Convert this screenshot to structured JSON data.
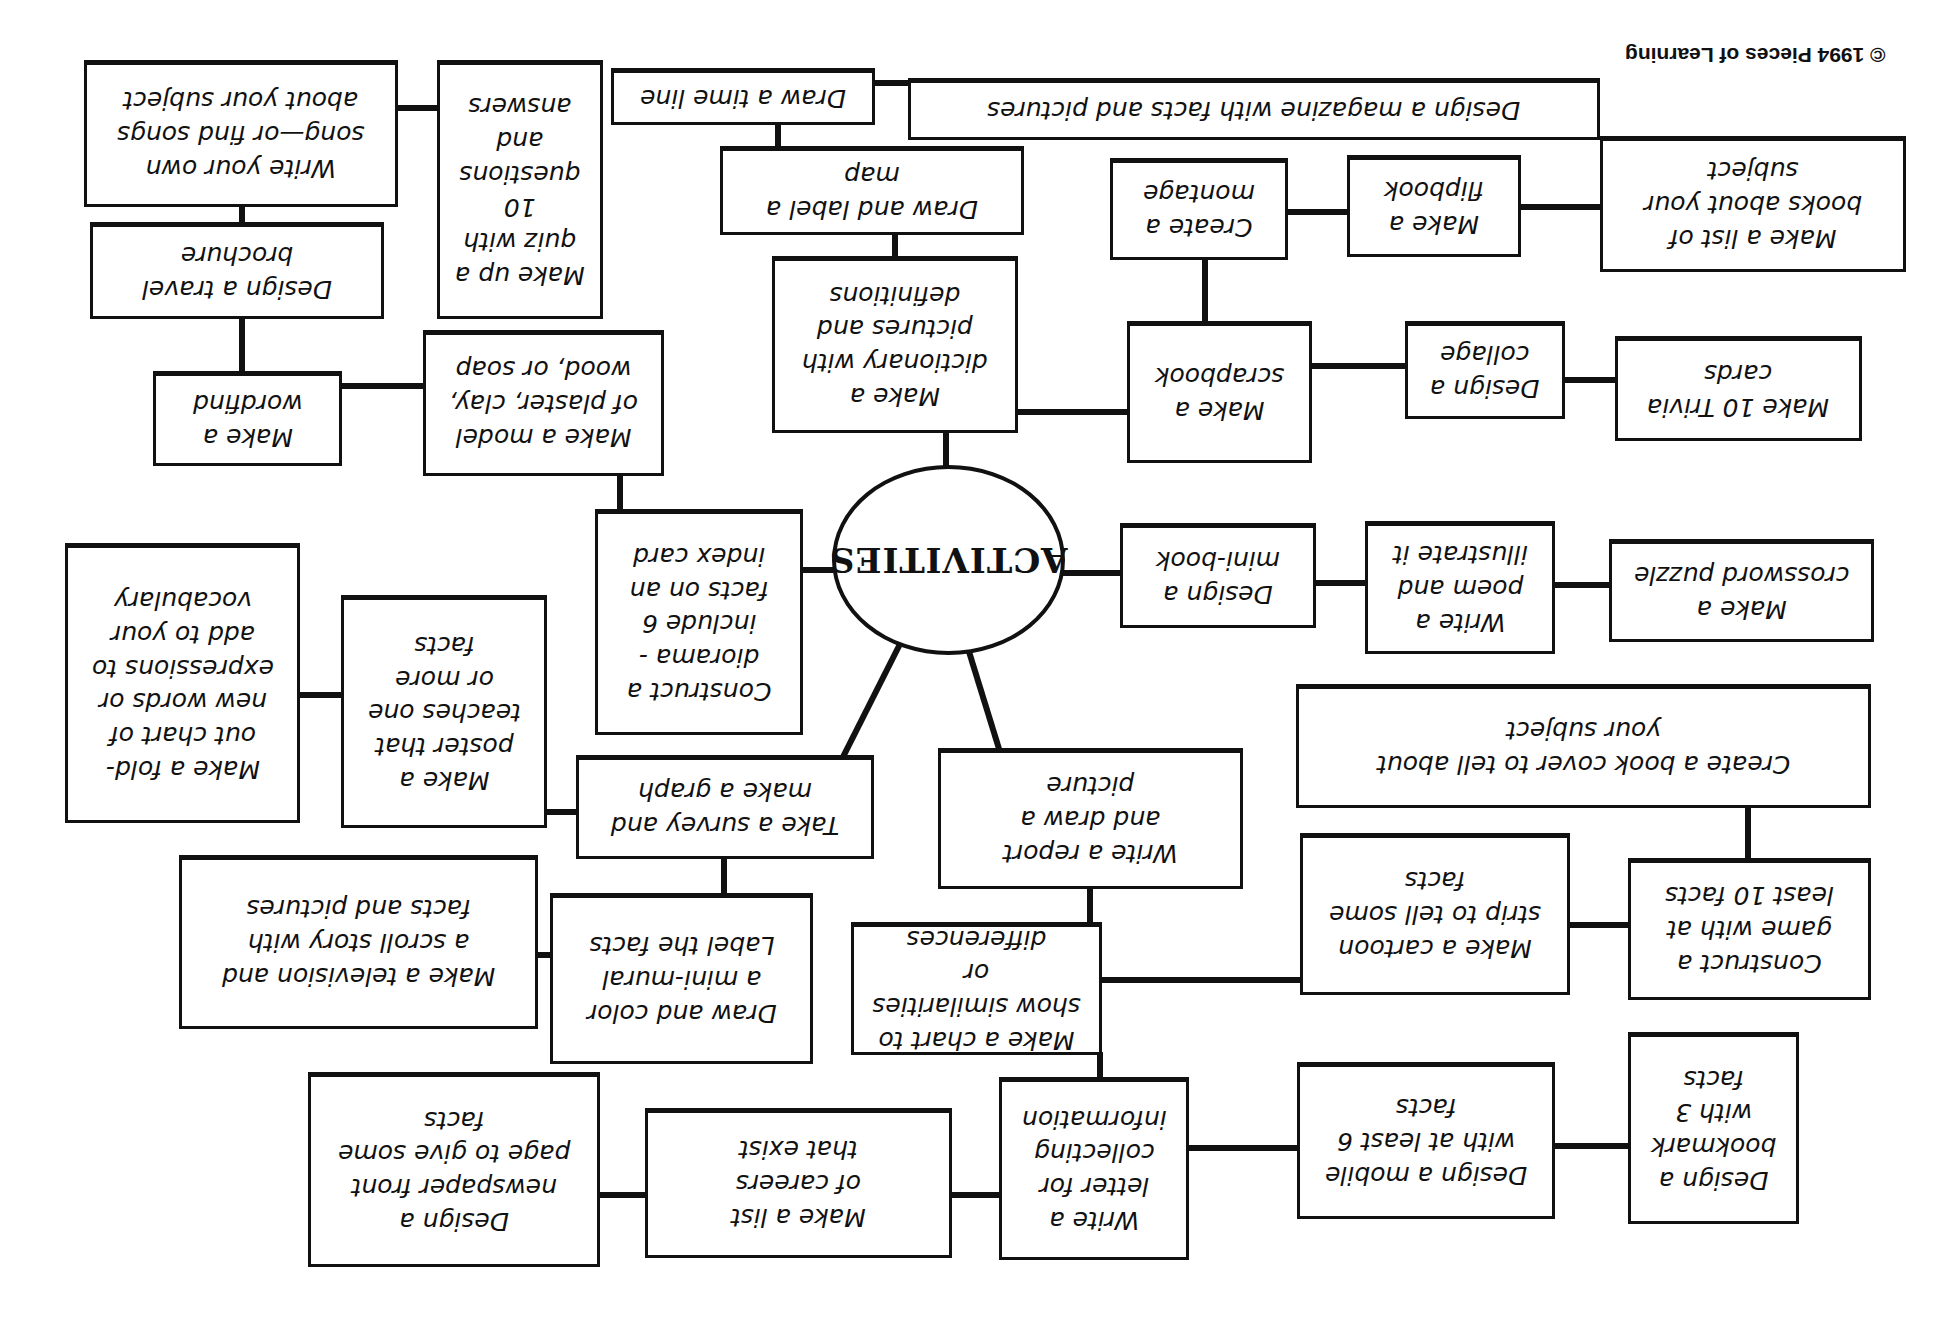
{
  "diagram": {
    "title": "ACTIVITIES",
    "orientation": "rotated 180 degrees (upside down)",
    "copyright": "© 1994 Pieces of Learning",
    "colors": {
      "ink": "#111111",
      "paper": "#ffffff"
    },
    "nodes": {
      "song": "Write your own\nsong—or find songs\nabout your subject",
      "quiz": "Make up a\nquiz with\n10\nquestions\nand\nanswers",
      "timeline": "Draw a time line",
      "magazine": "Design a magazine with facts and pictures",
      "books_list": "Make a list of\nbooks about your\nsubject",
      "brochure": "Design a travel\nbrochure",
      "map": "Draw and label a\nmap",
      "montage": "Create a\nmontage",
      "flipbook": "Make a\nflipbook",
      "dictionary": "Make a\ndictionary with\npictures and\ndefinitions",
      "wordfind": "Make a\nwordfind",
      "model": "Make a model\nof plaster, clay,\nwood, or soap",
      "scrapbook": "Make a\nscrapbook",
      "collage": "Design a\ncollage",
      "trivia": "Make 10 Trivia\ncards",
      "diorama": "Construct a\ndiorama -\ninclude 6\nfacts on an\nindex card",
      "minibook": "Design a\nmini-book",
      "poem": "Write a\npoem and\nillustrate it",
      "crossword": "Make a\ncrossword puzzle",
      "foldout": "Make a fold-\nout chart of\nnew words or\nexpressions to\nadd to your\nvocabulary",
      "poster": "Make a\nposter that\nteaches one\nor more\nfacts",
      "bookcover": "Create a book cover to tell about\nyour subject",
      "survey": "Take a survey and\nmake a graph",
      "report": "Write a report\nand draw a\npicture",
      "television": "Make a television and\na scroll story with\nfacts and pictures",
      "mural": "Draw and color\na mini-mural\nLabel the facts",
      "chart": "Make a chart to\nshow similarities or\ndifferences",
      "cartoon": "Make a cartoon\nstrip to tell some\nfacts",
      "game": "Construct a\ngame with at\nleast 10 facts",
      "newspaper": "Design a\nnewspaper front\npage to give some\nfacts",
      "careers": "Make a list\nof careers\nthat exist",
      "letter": "Write a\nletter for\ncollecting\ninformation",
      "mobile": "Design a mobile\nwith at least 6\nfacts",
      "bookmark": "Design a\nbookmark\nwith 3\nfacts"
    }
  }
}
